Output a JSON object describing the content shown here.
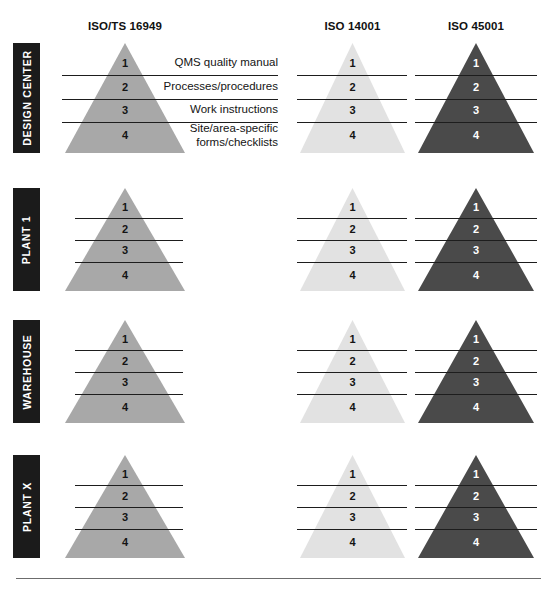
{
  "figure": {
    "columns": [
      {
        "id": "iso-ts-16949",
        "label": "ISO/TS 16949",
        "fill": "#a8a8a8",
        "number_style": "dark"
      },
      {
        "id": "iso-14001",
        "label": "ISO 14001",
        "fill": "#e2e2e2",
        "number_style": "dark"
      },
      {
        "id": "iso-45001",
        "label": "ISO 45001",
        "fill": "#4a4a4a",
        "number_style": "light"
      }
    ],
    "rows": [
      {
        "id": "design-center",
        "label": "DESIGN CENTER",
        "has_descriptions": true
      },
      {
        "id": "plant-1",
        "label": "PLANT 1",
        "has_descriptions": false
      },
      {
        "id": "warehouse",
        "label": "WAREHOUSE",
        "has_descriptions": false
      },
      {
        "id": "plant-x",
        "label": "PLANT X",
        "has_descriptions": false
      }
    ],
    "tiers": [
      {
        "number": "1",
        "description": "QMS quality manual"
      },
      {
        "number": "2",
        "description": "Processes/procedures"
      },
      {
        "number": "3",
        "description": "Work instructions"
      },
      {
        "number": "4",
        "description": "Site/area-specific\nforms/checklists"
      }
    ],
    "colors": {
      "label_chip_background": "#1b1b1b",
      "label_chip_text": "#ffffff",
      "divider": "#1d1d1d",
      "footer_rule": "#6c6c6c",
      "page_background": "#ffffff"
    },
    "footer": {
      "partial_text": ""
    }
  },
  "chart_data": {
    "type": "table",
    "xlabel": "ISO standard",
    "ylabel": "Site / location",
    "columns": [
      "ISO/TS 16949",
      "ISO 14001",
      "ISO 45001"
    ],
    "rows": [
      "DESIGN CENTER",
      "PLANT 1",
      "WAREHOUSE",
      "PLANT X"
    ],
    "tier_levels": [
      1,
      2,
      3,
      4
    ],
    "tier_labels": [
      "QMS quality manual",
      "Processes/procedures",
      "Work instructions",
      "Site/area-specific forms/checklists"
    ],
    "cells": [
      {
        "row": "DESIGN CENTER",
        "column": "ISO/TS 16949",
        "tiers": [
          1,
          2,
          3,
          4
        ],
        "shade": "#a8a8a8"
      },
      {
        "row": "DESIGN CENTER",
        "column": "ISO 14001",
        "tiers": [
          1,
          2,
          3,
          4
        ],
        "shade": "#e2e2e2"
      },
      {
        "row": "DESIGN CENTER",
        "column": "ISO 45001",
        "tiers": [
          1,
          2,
          3,
          4
        ],
        "shade": "#4a4a4a"
      },
      {
        "row": "PLANT 1",
        "column": "ISO/TS 16949",
        "tiers": [
          1,
          2,
          3,
          4
        ],
        "shade": "#a8a8a8"
      },
      {
        "row": "PLANT 1",
        "column": "ISO 14001",
        "tiers": [
          1,
          2,
          3,
          4
        ],
        "shade": "#e2e2e2"
      },
      {
        "row": "PLANT 1",
        "column": "ISO 45001",
        "tiers": [
          1,
          2,
          3,
          4
        ],
        "shade": "#4a4a4a"
      },
      {
        "row": "WAREHOUSE",
        "column": "ISO/TS 16949",
        "tiers": [
          1,
          2,
          3,
          4
        ],
        "shade": "#a8a8a8"
      },
      {
        "row": "WAREHOUSE",
        "column": "ISO 14001",
        "tiers": [
          1,
          2,
          3,
          4
        ],
        "shade": "#e2e2e2"
      },
      {
        "row": "WAREHOUSE",
        "column": "ISO 45001",
        "tiers": [
          1,
          2,
          3,
          4
        ],
        "shade": "#4a4a4a"
      },
      {
        "row": "PLANT X",
        "column": "ISO/TS 16949",
        "tiers": [
          1,
          2,
          3,
          4
        ],
        "shade": "#a8a8a8"
      },
      {
        "row": "PLANT X",
        "column": "ISO 14001",
        "tiers": [
          1,
          2,
          3,
          4
        ],
        "shade": "#e2e2e2"
      },
      {
        "row": "PLANT X",
        "column": "ISO 45001",
        "tiers": [
          1,
          2,
          3,
          4
        ],
        "shade": "#4a4a4a"
      }
    ],
    "legend": [],
    "grid": false
  }
}
